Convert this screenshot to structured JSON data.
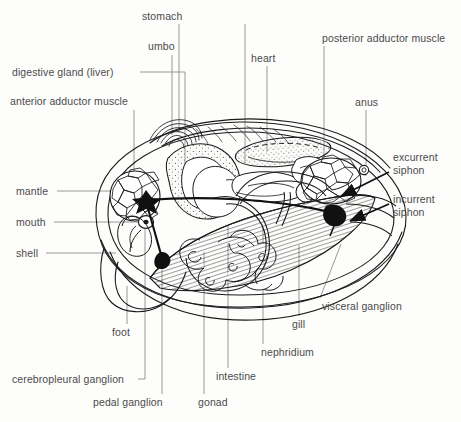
{
  "figure": {
    "background_color": "#fdfdfc",
    "ink_color": "#1a1a1a",
    "label_color": "#4b4b4b",
    "leader_color": "#6e6e6e",
    "width": 461,
    "height": 422
  },
  "labels": {
    "stomach": "stomach",
    "umbo": "umbo",
    "heart": "heart",
    "posterior_adductor_muscle": "posterior adductor muscle",
    "anus": "anus",
    "digestive_gland": "digestive gland (liver)",
    "anterior_adductor_muscle": "anterior adductor muscle",
    "mantle": "mantle",
    "mouth": "mouth",
    "shell": "shell",
    "excurrent_siphon_line1": "excurrent",
    "excurrent_siphon_line2": "siphon",
    "incurrent_siphon_line1": "incurrent",
    "incurrent_siphon_line2": "siphon",
    "visceral_ganglion": "visceral ganglion",
    "gill": "gill",
    "nephridium": "nephridium",
    "intestine": "intestine",
    "gonad": "gonad",
    "pedal_ganglion": "pedal ganglion",
    "cerebropleural_ganglion": "cerebropleural ganglion",
    "foot": "foot"
  },
  "anatomy_parts": [
    {
      "id": "stomach",
      "label": "stomach",
      "leader": "vertical",
      "label_x": 142,
      "label_y": 10,
      "target_x": 245,
      "target_y": 160
    },
    {
      "id": "umbo",
      "label": "umbo",
      "leader": "vertical",
      "label_x": 148,
      "label_y": 40,
      "target_x": 172,
      "target_y": 133
    },
    {
      "id": "heart",
      "label": "heart",
      "leader": "vertical",
      "label_x": 251,
      "label_y": 52,
      "target_x": 283,
      "target_y": 150
    },
    {
      "id": "posterior-adductor-muscle",
      "label": "posterior adductor muscle",
      "leader": "vertical",
      "label_x": 322,
      "label_y": 32,
      "target_x": 324,
      "target_y": 180
    },
    {
      "id": "anus",
      "label": "anus",
      "leader": "vertical",
      "label_x": 355,
      "label_y": 96,
      "target_x": 360,
      "target_y": 165
    },
    {
      "id": "digestive-gland-liver",
      "label": "digestive gland (liver)",
      "leader": "horizontal-then-down",
      "label_x": 12,
      "label_y": 67,
      "target_x": 163,
      "target_y": 155
    },
    {
      "id": "anterior-adductor-muscle",
      "label": "anterior adductor muscle",
      "leader": "vertical",
      "label_x": 10,
      "label_y": 96,
      "target_x": 136,
      "target_y": 186
    },
    {
      "id": "mantle",
      "label": "mantle",
      "leader": "horizontal",
      "label_x": 15,
      "label_y": 186,
      "target_x": 114,
      "target_y": 191
    },
    {
      "id": "mouth",
      "label": "mouth",
      "leader": "horizontal",
      "label_x": 15,
      "label_y": 218,
      "target_x": 142,
      "target_y": 222
    },
    {
      "id": "shell",
      "label": "shell",
      "leader": "horizontal",
      "label_x": 15,
      "label_y": 250,
      "target_x": 110,
      "target_y": 253
    },
    {
      "id": "excurrent-siphon",
      "label": "excurrent siphon",
      "leader": "arrow-left",
      "label_x": 393,
      "label_y": 157,
      "target_x": 343,
      "target_y": 196
    },
    {
      "id": "incurrent-siphon",
      "label": "incurrent siphon",
      "leader": "arrow-left",
      "label_x": 393,
      "label_y": 199,
      "target_x": 352,
      "target_y": 222
    },
    {
      "id": "visceral-ganglion",
      "label": "visceral ganglion",
      "leader": "diagonal",
      "label_x": 322,
      "label_y": 301,
      "target_x": 338,
      "target_y": 240
    },
    {
      "id": "gill",
      "label": "gill",
      "leader": "vertical",
      "label_x": 292,
      "label_y": 320,
      "target_x": 299,
      "target_y": 248
    },
    {
      "id": "nephridium",
      "label": "nephridium",
      "leader": "vertical",
      "label_x": 262,
      "label_y": 348,
      "target_x": 263,
      "target_y": 230
    },
    {
      "id": "intestine",
      "label": "intestine",
      "leader": "vertical",
      "label_x": 217,
      "label_y": 372,
      "target_x": 228,
      "target_y": 230
    },
    {
      "id": "gonad",
      "label": "gonad",
      "leader": "vertical",
      "label_x": 198,
      "label_y": 398,
      "target_x": 204,
      "target_y": 255
    },
    {
      "id": "pedal-ganglion",
      "label": "pedal ganglion",
      "leader": "vertical",
      "label_x": 93,
      "label_y": 398,
      "target_x": 162,
      "target_y": 260
    },
    {
      "id": "cerebropleural-ganglion",
      "label": "cerebropleural ganglion",
      "leader": "horizontal-then-up",
      "label_x": 12,
      "label_y": 375,
      "target_x": 145,
      "target_y": 200
    },
    {
      "id": "foot",
      "label": "foot",
      "leader": "vertical",
      "label_x": 112,
      "label_y": 328,
      "target_x": 127,
      "target_y": 285
    }
  ]
}
